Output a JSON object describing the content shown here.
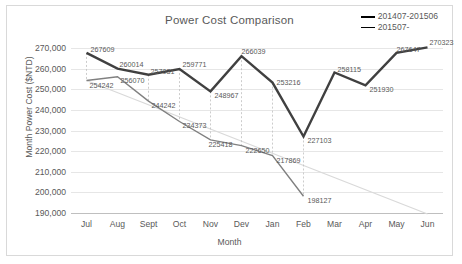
{
  "chart_data": {
    "type": "line",
    "title": "Power Cost Comparison",
    "xlabel": "Month",
    "ylabel": "Month Power Cost ($NTD)",
    "categories": [
      "Jul",
      "Aug",
      "Sept",
      "Oct",
      "Nov",
      "Dev",
      "Jan",
      "Feb",
      "Mar",
      "Apr",
      "May",
      "Jun"
    ],
    "ylim": [
      190000,
      270000
    ],
    "yticks": [
      "270,000",
      "260,000",
      "250,000",
      "240,000",
      "230,000",
      "220,000",
      "210,000",
      "200,000",
      "190,000"
    ],
    "ytick_values": [
      270000,
      260000,
      250000,
      240000,
      230000,
      220000,
      210000,
      200000,
      190000
    ],
    "grid": true,
    "legend_position": "top-right",
    "series": [
      {
        "name": "201407-201506",
        "color": "#404040",
        "width": 2.4,
        "values": [
          267609,
          260014,
          257031,
          259771,
          248967,
          266039,
          253216,
          227103,
          258115,
          251930,
          267647,
          270323
        ],
        "labels": [
          "267609",
          "260014",
          "257031",
          "259771",
          "248967",
          "266039",
          "253216",
          "227103",
          "258115",
          "251930",
          "267647",
          "270323"
        ]
      },
      {
        "name": "201507-",
        "color": "#808080",
        "width": 1.4,
        "values": [
          254242,
          256070,
          244242,
          234373,
          225418,
          222650,
          217869,
          198127,
          null,
          null,
          null,
          null
        ],
        "labels": [
          "254242",
          "256070",
          "244242",
          "234373",
          "225418",
          "222650",
          "217869",
          "198127"
        ]
      }
    ],
    "trendline": {
      "name": "trend",
      "color": "#d9d9d9",
      "from": [
        254242,
        0
      ],
      "to": [
        189500,
        11
      ]
    }
  },
  "legend": {
    "items": [
      {
        "label": "201407-201506"
      },
      {
        "label": "201507-"
      }
    ]
  }
}
